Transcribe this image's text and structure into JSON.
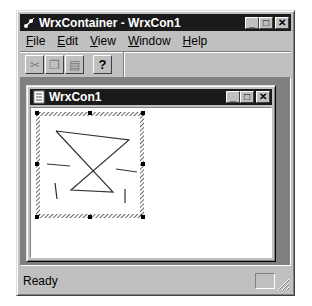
{
  "app": {
    "title": "WrxContainer - WrxCon1",
    "caption_buttons": {
      "minimize": "_",
      "maximize": "□",
      "close": "✕"
    }
  },
  "menubar": {
    "items": [
      {
        "label_u": "F",
        "label_rest": "ile"
      },
      {
        "label_u": "E",
        "label_rest": "dit"
      },
      {
        "label_u": "V",
        "label_rest": "iew"
      },
      {
        "label_u": "W",
        "label_rest": "indow"
      },
      {
        "label_u": "H",
        "label_rest": "elp"
      }
    ]
  },
  "toolbar": {
    "buttons": [
      {
        "icon": "cut-icon",
        "glyph": "✂",
        "enabled": false
      },
      {
        "icon": "copy-icon",
        "glyph": "❐",
        "enabled": false
      },
      {
        "icon": "paste-icon",
        "glyph": "▤",
        "enabled": false
      },
      {
        "icon": "help-icon",
        "glyph": "?",
        "enabled": true
      }
    ]
  },
  "child_window": {
    "title": "WrxCon1",
    "caption_buttons": {
      "minimize": "_",
      "maximize": "□",
      "close": "✕"
    }
  },
  "statusbar": {
    "text": "Ready"
  }
}
